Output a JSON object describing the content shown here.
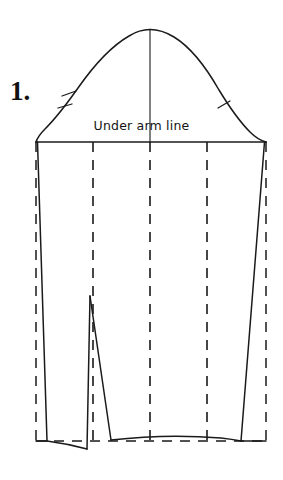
{
  "document": {
    "type": "sewing-pattern-diagram",
    "subject": "sleeve-pattern-with-darts",
    "background_color": "#ffffff",
    "ink_color": "#1a1a1a"
  },
  "labels": {
    "step_number": "1.",
    "underarm_line": "Under arm line"
  },
  "geometry": {
    "canvas": {
      "width": 283,
      "height": 480
    },
    "underarm_line_y": 142,
    "hem_line_y": 440,
    "cap_apex": {
      "x": 150,
      "y": 30
    },
    "cap_left_base": {
      "x": 36,
      "y": 142
    },
    "cap_right_base": {
      "x": 266,
      "y": 142
    },
    "center_line_x": 150,
    "grain_lines_x": [
      93,
      150,
      207
    ],
    "side_seam_left_top_x": 37,
    "side_seam_left_bottom_x": 46,
    "side_seam_right_top_x": 265,
    "side_seam_right_bottom_x": 241,
    "dart_apex": {
      "x": 90,
      "y": 296
    },
    "dart_left_base": {
      "x": 87,
      "y": 444
    },
    "dart_right_base": {
      "x": 110,
      "y": 440
    }
  },
  "notches": {
    "left_cap": [
      {
        "x": 66,
        "y": 100,
        "angle_deg": 20
      },
      {
        "x": 59,
        "y": 112,
        "angle_deg": 20
      }
    ],
    "right_cap": [
      {
        "x": 222,
        "y": 105,
        "angle_deg": -25
      }
    ]
  },
  "line_styles": {
    "solid": "cutting-line",
    "dashed": "fold-or-grain-line",
    "dash_pattern": "10 8"
  }
}
